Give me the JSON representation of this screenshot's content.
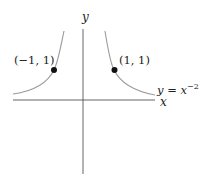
{
  "diagram": {
    "function_label": {
      "lhs": "y",
      "eq": " = ",
      "base": "x",
      "exponent": "−2"
    },
    "axes": {
      "x_label": "x",
      "y_label": "y"
    },
    "points": [
      {
        "label": "(−1, 1)",
        "x": -1,
        "y": 1
      },
      {
        "label": "(1, 1)",
        "x": 1,
        "y": 1
      }
    ],
    "colors": {
      "axis": "#555555",
      "curve": "#9a9a9a",
      "point": "#111111",
      "text": "#222222"
    }
  }
}
